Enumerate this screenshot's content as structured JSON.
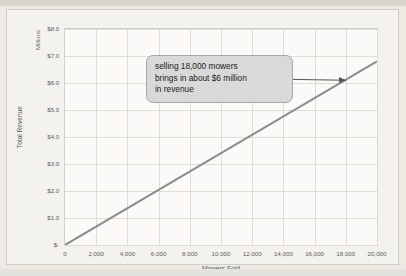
{
  "chart_data": {
    "type": "line",
    "title": "",
    "subtitle": "",
    "xlabel": "Mowers Sold",
    "ylabel": "Total Revenue",
    "y_units_label": "Millions",
    "xlim": [
      0,
      20000
    ],
    "ylim": [
      0,
      8
    ],
    "grid": true,
    "legend": "none",
    "x_tick_labels": [
      "0",
      "2,000",
      "4,000",
      "6,000",
      "8,000",
      "10,000",
      "12,000",
      "14,000",
      "16,000",
      "18,000",
      "20,000"
    ],
    "x_tick_values": [
      0,
      2000,
      4000,
      6000,
      8000,
      10000,
      12000,
      14000,
      16000,
      18000,
      20000
    ],
    "y_tick_labels": [
      "$-",
      "$1.0",
      "$2.0",
      "$3.0",
      "$4.0",
      "$5.0",
      "$6.0",
      "$7.0",
      "$8.0"
    ],
    "y_tick_values": [
      0,
      1,
      2,
      3,
      4,
      5,
      6,
      7,
      8
    ],
    "series": [
      {
        "name": "Total Revenue",
        "color": "#8c8c8c",
        "x": [
          0,
          20000
        ],
        "values": [
          0,
          6.8
        ]
      }
    ],
    "annotations": [
      {
        "type": "callout",
        "lines": [
          "selling 18,000 mowers",
          "brings in about $6 million",
          "in revenue"
        ],
        "arrow": {
          "from_x": 13000,
          "from_y": 6.15,
          "to_x": 18000,
          "to_y": 6.1,
          "color": "#595959"
        }
      }
    ]
  },
  "colors": {
    "line": "#8c8c8c",
    "grid": "#dedcd5",
    "plot_background": "#fbfaf8",
    "chart_background": "#f3f2ee",
    "page_background": "#eceae3",
    "callout_fill": "#d9d9d9",
    "callout_border": "#a6a6a6",
    "tick_text": "#5d5d5d"
  }
}
